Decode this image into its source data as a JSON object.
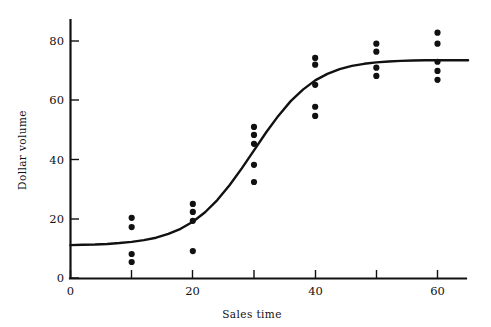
{
  "chart_data": {
    "type": "scatter",
    "title": "",
    "subtitle": "",
    "xlabel": "Sales time",
    "ylabel": "Dollar volume",
    "xlim": [
      0,
      65
    ],
    "ylim": [
      0,
      88
    ],
    "grid": false,
    "legend": null,
    "xticks": [
      0,
      20,
      40,
      60
    ],
    "xtick_labels": [
      "0",
      "20",
      "40",
      "60"
    ],
    "xticks_minor": [
      10,
      30,
      50
    ],
    "yticks": [
      0,
      20,
      40,
      60,
      80
    ],
    "ytick_labels": [
      "0",
      "20",
      "40",
      "60",
      "80"
    ],
    "points": [
      {
        "x": 10,
        "y": 20.3
      },
      {
        "x": 10,
        "y": 17.2
      },
      {
        "x": 10,
        "y": 8.1
      },
      {
        "x": 10,
        "y": 5.4
      },
      {
        "x": 20,
        "y": 25.0
      },
      {
        "x": 20,
        "y": 22.3
      },
      {
        "x": 20,
        "y": 19.3
      },
      {
        "x": 20,
        "y": 9.1
      },
      {
        "x": 30,
        "y": 51.0
      },
      {
        "x": 30,
        "y": 48.3
      },
      {
        "x": 30,
        "y": 45.3
      },
      {
        "x": 30,
        "y": 38.2
      },
      {
        "x": 30,
        "y": 32.4
      },
      {
        "x": 40,
        "y": 74.3
      },
      {
        "x": 40,
        "y": 72.0
      },
      {
        "x": 40,
        "y": 65.2
      },
      {
        "x": 40,
        "y": 57.8
      },
      {
        "x": 40,
        "y": 54.7
      },
      {
        "x": 50,
        "y": 79.1
      },
      {
        "x": 50,
        "y": 76.4
      },
      {
        "x": 50,
        "y": 71.0
      },
      {
        "x": 50,
        "y": 68.2
      },
      {
        "x": 60,
        "y": 82.8
      },
      {
        "x": 60,
        "y": 79.1
      },
      {
        "x": 60,
        "y": 73.0
      },
      {
        "x": 60,
        "y": 69.9
      },
      {
        "x": 60,
        "y": 66.9
      }
    ],
    "series": [
      {
        "name": "fitted logistic curve",
        "type": "line",
        "curve": "logistic",
        "params": {
          "lower_asymptote": 11.0,
          "upper_asymptote": 73.5,
          "midpoint_x": 30.5,
          "growth_rate": 0.205
        },
        "x": [
          0,
          2,
          4,
          6,
          8,
          10,
          12,
          14,
          16,
          18,
          20,
          22,
          24,
          26,
          28,
          30,
          32,
          34,
          36,
          38,
          40,
          42,
          44,
          46,
          48,
          50,
          52,
          54,
          56,
          58,
          60,
          62,
          64,
          65
        ],
        "values": [
          11.1,
          11.2,
          11.3,
          11.5,
          11.8,
          12.2,
          12.8,
          13.6,
          14.9,
          16.6,
          19.0,
          22.2,
          26.3,
          31.3,
          37.0,
          43.1,
          49.2,
          54.8,
          59.7,
          63.6,
          66.7,
          68.9,
          70.5,
          71.6,
          72.3,
          72.8,
          73.1,
          73.3,
          73.4,
          73.5,
          73.5,
          73.5,
          73.5,
          73.5
        ]
      }
    ],
    "point_color": "#111111",
    "line_color": "#111111",
    "axis_color": "#111111",
    "background_color": "#ffffff"
  },
  "axes": {
    "y_title": "Dollar volume",
    "x_title": "Sales time",
    "y_tick_0": "0",
    "y_tick_20": "20",
    "y_tick_40": "40",
    "y_tick_60": "60",
    "y_tick_80": "80",
    "x_tick_0": "0",
    "x_tick_20": "20",
    "x_tick_40": "40",
    "x_tick_60": "60"
  }
}
